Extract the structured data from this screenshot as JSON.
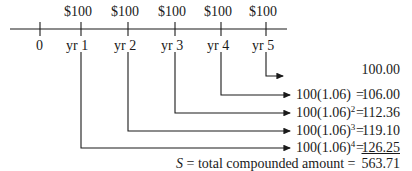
{
  "timeline": {
    "payments": [
      {
        "label": "$100",
        "x": 81
      },
      {
        "label": "$100",
        "x": 128
      },
      {
        "label": "$100",
        "x": 175
      },
      {
        "label": "$100",
        "x": 221
      },
      {
        "label": "$100",
        "x": 266
      }
    ],
    "ticks": [
      {
        "label": "0",
        "x": 40
      },
      {
        "label": "yr 1",
        "x": 81
      },
      {
        "label": "yr 2",
        "x": 128
      },
      {
        "label": "yr 3",
        "x": 175
      },
      {
        "label": "yr 4",
        "x": 221
      },
      {
        "label": "yr 5",
        "x": 266
      }
    ]
  },
  "rows": [
    {
      "expr": "",
      "exp": "",
      "eq": "",
      "value": "100.00"
    },
    {
      "expr": "100(1.06)",
      "exp": "",
      "eq": "=",
      "value": "106.00"
    },
    {
      "expr": "100(1.06)",
      "exp": "2",
      "eq": "=",
      "value": "112.36"
    },
    {
      "expr": "100(1.06)",
      "exp": "3",
      "eq": "=",
      "value": "119.10"
    },
    {
      "expr": "100(1.06)",
      "exp": "4",
      "eq": "=",
      "value": "126.25"
    }
  ],
  "total": {
    "symbol": "S",
    "eq1": "=",
    "label": "total compounded amount",
    "eq2": "=",
    "value": "563.71"
  }
}
